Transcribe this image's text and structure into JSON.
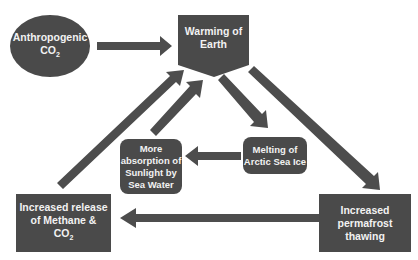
{
  "diagram": {
    "colors": {
      "shape_fill": "#4a4a4a",
      "arrow_fill": "#4d4d4d",
      "text": "#f2f2f2",
      "background": "#ffffff"
    },
    "nodes": {
      "anthropogenic": {
        "line1": "Anthropogenic",
        "line2": "CO",
        "sub": "2"
      },
      "warming": {
        "line1": "Warming of",
        "line2": "Earth"
      },
      "melting": {
        "line1": "Melting  of",
        "line2": "Arctic Sea Ice"
      },
      "absorption": {
        "line1": "More",
        "line2": "absorption of",
        "line3": "Sunlight by",
        "line4": "Sea Water"
      },
      "methane": {
        "line1": "Increased release",
        "line2": "of Methane &",
        "line3": "CO",
        "sub": "2"
      },
      "permafrost": {
        "line1": "Increased",
        "line2": "permafrost",
        "line3": "thawing"
      }
    },
    "edges": [
      {
        "from": "Anthropogenic CO2",
        "to": "Warming of Earth"
      },
      {
        "from": "Warming of Earth",
        "to": "Melting of Arctic Sea Ice"
      },
      {
        "from": "Melting of Arctic Sea Ice",
        "to": "More absorption of Sunlight by Sea Water"
      },
      {
        "from": "More absorption of Sunlight by Sea Water",
        "to": "Warming of Earth"
      },
      {
        "from": "Warming of Earth",
        "to": "Increased permafrost thawing"
      },
      {
        "from": "Increased permafrost thawing",
        "to": "Increased release of Methane & CO2"
      },
      {
        "from": "Increased release of Methane & CO2",
        "to": "Warming of Earth"
      }
    ]
  }
}
